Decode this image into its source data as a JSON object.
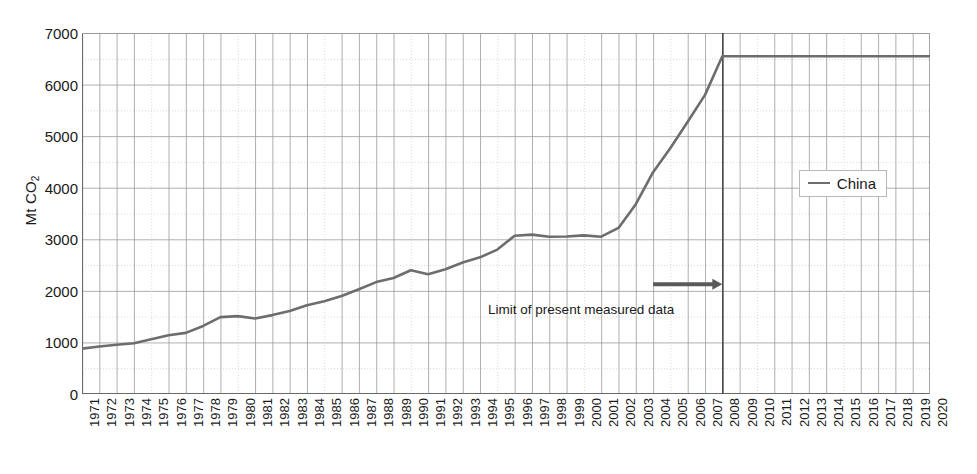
{
  "chart_data": {
    "type": "line",
    "title": "",
    "xlabel": "",
    "ylabel": "Mt CO2",
    "ylabel_display": "Mt CO",
    "ylabel_subscript": "2",
    "xlim": [
      1971,
      2020
    ],
    "ylim": [
      0,
      7000
    ],
    "ytick_step": 1000,
    "yticks": [
      0,
      1000,
      2000,
      3000,
      4000,
      5000,
      6000,
      7000
    ],
    "ytick_labels": [
      "0",
      "1000",
      "2000",
      "3000",
      "4000",
      "5000",
      "6000",
      "7000"
    ],
    "grid": true,
    "grid_color": "#9a9a9a",
    "minor_grid_color": "#cfcfcf",
    "legend_position": "right",
    "categories": [
      "1971",
      "1972",
      "1973",
      "1974",
      "1975",
      "1976",
      "1977",
      "1978",
      "1979",
      "1980",
      "1981",
      "1982",
      "1983",
      "1984",
      "1985",
      "1986",
      "1987",
      "1988",
      "1989",
      "1990",
      "1991",
      "1992",
      "1993",
      "1994",
      "1995",
      "1996",
      "1997",
      "1998",
      "1999",
      "2000",
      "2001",
      "2002",
      "2003",
      "2004",
      "2005",
      "2006",
      "2007",
      "2008",
      "2009",
      "2010",
      "2011",
      "2012",
      "2013",
      "2014",
      "2015",
      "2016",
      "2017",
      "2018",
      "2019",
      "2020"
    ],
    "series": [
      {
        "name": "China",
        "color": "#6d6d6d",
        "values": [
          880,
          920,
          955,
          985,
          1060,
          1140,
          1185,
          1320,
          1490,
          1510,
          1465,
          1530,
          1610,
          1720,
          1800,
          1900,
          2030,
          2170,
          2250,
          2400,
          2320,
          2420,
          2550,
          2650,
          2800,
          3070,
          3090,
          3050,
          3055,
          3075,
          3050,
          3220,
          3680,
          4300,
          4770,
          5280,
          5800,
          6550,
          6550,
          6550,
          6550,
          6550,
          6550,
          6550,
          6550,
          6550,
          6550,
          6550,
          6550,
          6550
        ]
      }
    ],
    "annotations": [
      {
        "id": "limit-of-measured-data",
        "text": "Limit of present measured data",
        "arrow_from_year": 2004,
        "arrow_to_year": 2008,
        "arrow_y_value": 2130,
        "arrow_color": "#5a5a5a"
      },
      {
        "id": "measured-data-boundary",
        "type": "vline",
        "at_year": 2008,
        "color": "#4a4a4a"
      }
    ]
  },
  "legend": {
    "entries": [
      {
        "label": "China",
        "color": "#6d6d6d",
        "swatch": "line-swatch-icon"
      }
    ]
  }
}
